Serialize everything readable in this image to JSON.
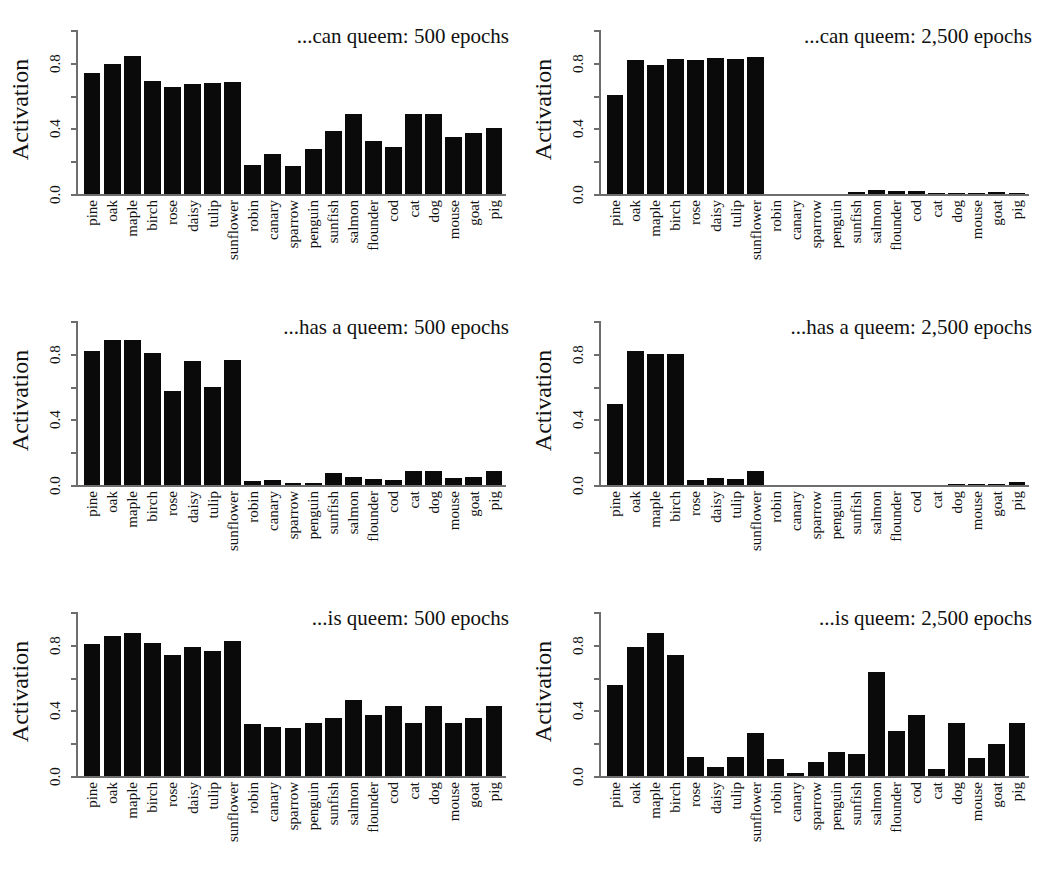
{
  "figure": {
    "axis_label_y": "Activation",
    "y_ticks": [
      "0.0",
      "0.4",
      "0.8"
    ],
    "categories": [
      "pine",
      "oak",
      "maple",
      "birch",
      "rose",
      "daisy",
      "tulip",
      "sunflower",
      "robin",
      "canary",
      "sparrow",
      "penguin",
      "sunfish",
      "salmon",
      "flounder",
      "cod",
      "cat",
      "dog",
      "mouse",
      "goat",
      "pig"
    ]
  },
  "chart_data": [
    {
      "type": "bar",
      "title": "...can queem: 500 epochs",
      "xlabel": "",
      "ylabel": "Activation",
      "ylim": [
        0,
        1.0
      ],
      "yticks": [
        0.0,
        0.4,
        0.8
      ],
      "grid": false,
      "legend": "none",
      "categories": [
        "pine",
        "oak",
        "maple",
        "birch",
        "rose",
        "daisy",
        "tulip",
        "sunflower",
        "robin",
        "canary",
        "sparrow",
        "penguin",
        "sunfish",
        "salmon",
        "flounder",
        "cod",
        "cat",
        "dog",
        "mouse",
        "goat",
        "pig"
      ],
      "values": [
        0.74,
        0.79,
        0.84,
        0.69,
        0.65,
        0.67,
        0.675,
        0.68,
        0.175,
        0.245,
        0.17,
        0.275,
        0.385,
        0.49,
        0.325,
        0.285,
        0.49,
        0.49,
        0.35,
        0.375,
        0.405
      ]
    },
    {
      "type": "bar",
      "title": "...can queem: 2,500 epochs",
      "xlabel": "",
      "ylabel": "Activation",
      "ylim": [
        0,
        1.0
      ],
      "yticks": [
        0.0,
        0.4,
        0.8
      ],
      "grid": false,
      "legend": "none",
      "categories": [
        "pine",
        "oak",
        "maple",
        "birch",
        "rose",
        "daisy",
        "tulip",
        "sunflower",
        "robin",
        "canary",
        "sparrow",
        "penguin",
        "sunfish",
        "salmon",
        "flounder",
        "cod",
        "cat",
        "dog",
        "mouse",
        "goat",
        "pig"
      ],
      "values": [
        0.605,
        0.82,
        0.785,
        0.825,
        0.82,
        0.83,
        0.825,
        0.835,
        0.0,
        0.0,
        0.0,
        0.0,
        0.01,
        0.025,
        0.02,
        0.018,
        0.008,
        0.008,
        0.004,
        0.015,
        0.005
      ]
    },
    {
      "type": "bar",
      "title": "...has a queem: 500 epochs",
      "xlabel": "",
      "ylabel": "Activation",
      "ylim": [
        0,
        1.0
      ],
      "yticks": [
        0.0,
        0.4,
        0.8
      ],
      "grid": false,
      "legend": "none",
      "categories": [
        "pine",
        "oak",
        "maple",
        "birch",
        "rose",
        "daisy",
        "tulip",
        "sunflower",
        "robin",
        "canary",
        "sparrow",
        "penguin",
        "sunfish",
        "salmon",
        "flounder",
        "cod",
        "cat",
        "dog",
        "mouse",
        "goat",
        "pig"
      ],
      "values": [
        0.815,
        0.885,
        0.885,
        0.805,
        0.575,
        0.755,
        0.595,
        0.765,
        0.025,
        0.03,
        0.012,
        0.015,
        0.075,
        0.05,
        0.035,
        0.03,
        0.085,
        0.085,
        0.04,
        0.05,
        0.085
      ]
    },
    {
      "type": "bar",
      "title": "...has a queem: 2,500 epochs",
      "xlabel": "",
      "ylabel": "Activation",
      "ylim": [
        0,
        1.0
      ],
      "yticks": [
        0.0,
        0.4,
        0.8
      ],
      "grid": false,
      "legend": "none",
      "categories": [
        "pine",
        "oak",
        "maple",
        "birch",
        "rose",
        "daisy",
        "tulip",
        "sunflower",
        "robin",
        "canary",
        "sparrow",
        "penguin",
        "sunfish",
        "salmon",
        "flounder",
        "cod",
        "cat",
        "dog",
        "mouse",
        "goat",
        "pig"
      ],
      "values": [
        0.495,
        0.82,
        0.8,
        0.8,
        0.03,
        0.045,
        0.035,
        0.085,
        0.0,
        0.0,
        0.0,
        0.0,
        0.0,
        0.0,
        0.0,
        0.0,
        0.0,
        0.004,
        0.004,
        0.008,
        0.02
      ]
    },
    {
      "type": "bar",
      "title": "...is queem: 500 epochs",
      "xlabel": "",
      "ylabel": "Activation",
      "ylim": [
        0,
        1.0
      ],
      "yticks": [
        0.0,
        0.4,
        0.8
      ],
      "grid": false,
      "legend": "none",
      "categories": [
        "pine",
        "oak",
        "maple",
        "birch",
        "rose",
        "daisy",
        "tulip",
        "sunflower",
        "robin",
        "canary",
        "sparrow",
        "penguin",
        "sunfish",
        "salmon",
        "flounder",
        "cod",
        "cat",
        "dog",
        "mouse",
        "goat",
        "pig"
      ],
      "values": [
        0.805,
        0.855,
        0.875,
        0.81,
        0.735,
        0.785,
        0.765,
        0.825,
        0.315,
        0.3,
        0.295,
        0.325,
        0.355,
        0.465,
        0.375,
        0.425,
        0.325,
        0.425,
        0.325,
        0.355,
        0.425
      ]
    },
    {
      "type": "bar",
      "title": "...is queem: 2,500 epochs",
      "xlabel": "",
      "ylabel": "Activation",
      "ylim": [
        0,
        1.0
      ],
      "yticks": [
        0.0,
        0.4,
        0.8
      ],
      "grid": false,
      "legend": "none",
      "categories": [
        "pine",
        "oak",
        "maple",
        "birch",
        "rose",
        "daisy",
        "tulip",
        "sunflower",
        "robin",
        "canary",
        "sparrow",
        "penguin",
        "sunfish",
        "salmon",
        "flounder",
        "cod",
        "cat",
        "dog",
        "mouse",
        "goat",
        "pig"
      ],
      "values": [
        0.555,
        0.785,
        0.875,
        0.735,
        0.115,
        0.055,
        0.115,
        0.265,
        0.105,
        0.02,
        0.085,
        0.145,
        0.135,
        0.635,
        0.275,
        0.375,
        0.045,
        0.325,
        0.11,
        0.195,
        0.325
      ]
    }
  ],
  "colors": {
    "bar": "#0a0a0a",
    "axis": "#6d6d6d",
    "text": "#111111",
    "background": "#ffffff"
  }
}
